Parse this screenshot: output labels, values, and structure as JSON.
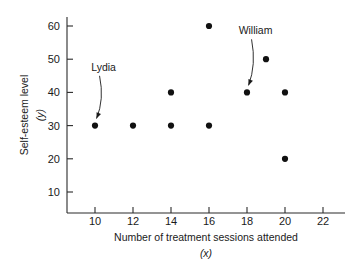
{
  "chart_data": {
    "type": "scatter",
    "title": "",
    "xlabel": "Number of treatment sessions attended",
    "xlabel_var": "(x)",
    "ylabel": "Self-esteem level",
    "ylabel_var": "(y)",
    "xlim": [
      8.5,
      23.5
    ],
    "ylim": [
      0,
      65
    ],
    "xticks": [
      10,
      12,
      14,
      16,
      18,
      20,
      22
    ],
    "xtick_labels": [
      "10",
      "12",
      "14",
      "16",
      "18",
      "20",
      "22"
    ],
    "yticks": [
      10,
      20,
      30,
      40,
      50,
      60
    ],
    "ytick_labels": [
      "10",
      "20",
      "30",
      "40",
      "50",
      "60"
    ],
    "grid": false,
    "legend": false,
    "points": [
      {
        "x": 10,
        "y": 30
      },
      {
        "x": 12,
        "y": 30
      },
      {
        "x": 14,
        "y": 30
      },
      {
        "x": 14,
        "y": 40
      },
      {
        "x": 16,
        "y": 30
      },
      {
        "x": 16,
        "y": 60
      },
      {
        "x": 18,
        "y": 40
      },
      {
        "x": 19,
        "y": 50
      },
      {
        "x": 20,
        "y": 20
      },
      {
        "x": 20,
        "y": 40
      }
    ],
    "annotations": [
      {
        "label": "Lydia",
        "label_x": 10.45,
        "label_y": 46.5,
        "target_x": 10,
        "target_y": 30
      },
      {
        "label": "William",
        "label_x": 18.45,
        "label_y": 57.5,
        "target_x": 18,
        "target_y": 40
      }
    ],
    "marker_color": "#111111",
    "axis_color": "#2b2b2b",
    "background_color": "#ffffff",
    "marker_size_px": 3.1
  }
}
